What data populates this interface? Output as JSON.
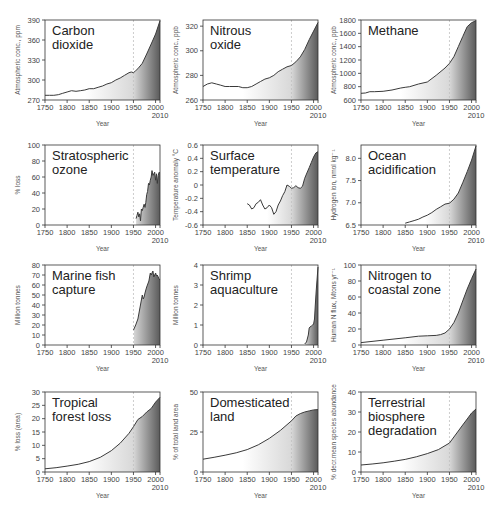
{
  "figure": {
    "colors": {
      "line": "#3a3a3a",
      "fill_light": "#ffffff",
      "fill_dark": "#5a5a5a",
      "axis": "#333333",
      "ref_line": "#c0c0c0",
      "text": "#222222"
    },
    "reference_year": 1950
  },
  "chart_data": [
    {
      "type": "area",
      "title": "Carbon dioxide",
      "title_lines": [
        "Carbon",
        "dioxide"
      ],
      "xlabel": "Year",
      "ylabel": "Atmospheric conc., ppm",
      "xlim": [
        1750,
        2010
      ],
      "ylim": [
        270,
        390
      ],
      "xticks": [
        1750,
        1800,
        1850,
        1900,
        1950,
        2000
      ],
      "xtick_extra": "2010",
      "yticks": [
        270,
        300,
        330,
        360,
        390
      ],
      "ref_line_x": 1950,
      "x": [
        1750,
        1760,
        1770,
        1780,
        1790,
        1800,
        1810,
        1820,
        1830,
        1840,
        1850,
        1860,
        1870,
        1880,
        1890,
        1900,
        1910,
        1920,
        1930,
        1940,
        1945,
        1950,
        1955,
        1960,
        1970,
        1980,
        1990,
        2000,
        2010
      ],
      "values": [
        277,
        277,
        277,
        278,
        280,
        282,
        284,
        283,
        284,
        285,
        287,
        287,
        289,
        291,
        294,
        296,
        300,
        303,
        307,
        311,
        312,
        311,
        314,
        317,
        325,
        339,
        354,
        369,
        389
      ]
    },
    {
      "type": "area",
      "title": "Nitrous oxide",
      "title_lines": [
        "Nitrous",
        "oxide"
      ],
      "xlabel": "Year",
      "ylabel": "Atmospheric conc., ppb",
      "xlim": [
        1750,
        2010
      ],
      "ylim": [
        260,
        325
      ],
      "xticks": [
        1750,
        1800,
        1850,
        1900,
        1950,
        2000
      ],
      "xtick_extra": "2010",
      "yticks": [
        260,
        280,
        300,
        320
      ],
      "ref_line_x": 1950,
      "x": [
        1750,
        1760,
        1770,
        1780,
        1790,
        1800,
        1810,
        1820,
        1830,
        1840,
        1850,
        1860,
        1870,
        1880,
        1890,
        1900,
        1910,
        1920,
        1930,
        1940,
        1950,
        1960,
        1970,
        1980,
        1990,
        2000,
        2010
      ],
      "values": [
        271,
        273,
        274,
        273,
        272,
        271,
        271,
        271,
        271,
        270,
        270,
        271,
        273,
        275,
        277,
        278,
        280,
        283,
        285,
        287,
        288,
        291,
        295,
        301,
        309,
        316,
        323
      ]
    },
    {
      "type": "area",
      "title": "Methane",
      "title_lines": [
        "Methane"
      ],
      "xlabel": "Year",
      "ylabel": "Atmospheric conc., ppb",
      "xlim": [
        1750,
        2010
      ],
      "ylim": [
        600,
        1800
      ],
      "xticks": [
        1750,
        1800,
        1850,
        1900,
        1950,
        2000
      ],
      "xtick_extra": "2010",
      "yticks": [
        600,
        800,
        1000,
        1200,
        1400,
        1600,
        1800
      ],
      "ref_line_x": 1950,
      "x": [
        1750,
        1760,
        1770,
        1780,
        1800,
        1820,
        1840,
        1850,
        1860,
        1880,
        1900,
        1920,
        1940,
        1950,
        1960,
        1970,
        1980,
        1990,
        2000,
        2010
      ],
      "values": [
        700,
        705,
        725,
        725,
        730,
        750,
        780,
        790,
        800,
        840,
        870,
        970,
        1080,
        1150,
        1250,
        1400,
        1550,
        1700,
        1760,
        1790
      ]
    },
    {
      "type": "area",
      "title": "Stratospheric ozone",
      "title_lines": [
        "Stratospheric",
        "ozone"
      ],
      "xlabel": "Year",
      "ylabel": "% loss",
      "xlim": [
        1750,
        2010
      ],
      "ylim": [
        0,
        100
      ],
      "xticks": [
        1750,
        1800,
        1850,
        1900,
        1950,
        2000
      ],
      "xtick_extra": "2010",
      "yticks": [
        0,
        20,
        40,
        60,
        80,
        100
      ],
      "ref_line_x": 1950,
      "x": [
        1956,
        1958,
        1960,
        1962,
        1964,
        1966,
        1968,
        1970,
        1972,
        1974,
        1976,
        1978,
        1980,
        1982,
        1984,
        1986,
        1988,
        1990,
        1992,
        1994,
        1996,
        1998,
        2000,
        2002,
        2004,
        2006,
        2008,
        2010
      ],
      "values": [
        8,
        12,
        16,
        10,
        14,
        5,
        20,
        18,
        22,
        26,
        22,
        28,
        38,
        42,
        52,
        50,
        56,
        60,
        68,
        62,
        64,
        66,
        56,
        64,
        52,
        62,
        66,
        65
      ]
    },
    {
      "type": "area",
      "title": "Surface temperature",
      "title_lines": [
        "Surface",
        "temperature"
      ],
      "xlabel": "Year",
      "ylabel": "Temperature anomaly °C",
      "xlim": [
        1750,
        2010
      ],
      "ylim": [
        -0.6,
        0.6
      ],
      "xticks": [
        1750,
        1800,
        1850,
        1900,
        1950,
        2000
      ],
      "xtick_extra": "2010",
      "yticks": [
        -0.6,
        -0.4,
        -0.2,
        0,
        0.2,
        0.4,
        0.6
      ],
      "ref_line_x": 1950,
      "x": [
        1850,
        1855,
        1860,
        1865,
        1870,
        1875,
        1880,
        1885,
        1890,
        1895,
        1900,
        1905,
        1910,
        1915,
        1920,
        1925,
        1930,
        1935,
        1940,
        1945,
        1950,
        1955,
        1960,
        1965,
        1970,
        1975,
        1980,
        1985,
        1990,
        1995,
        2000,
        2005,
        2010
      ],
      "values": [
        -0.28,
        -0.3,
        -0.36,
        -0.34,
        -0.28,
        -0.26,
        -0.22,
        -0.3,
        -0.36,
        -0.34,
        -0.3,
        -0.34,
        -0.44,
        -0.4,
        -0.3,
        -0.24,
        -0.16,
        -0.1,
        0.0,
        -0.02,
        -0.05,
        -0.04,
        -0.01,
        -0.04,
        -0.05,
        -0.02,
        0.1,
        0.18,
        0.26,
        0.34,
        0.42,
        0.48,
        0.5
      ]
    },
    {
      "type": "area",
      "title": "Ocean acidification",
      "title_lines": [
        "Ocean",
        "acidification"
      ],
      "xlabel": "Year",
      "ylabel": "Hydrogen ion, nmol kg⁻¹",
      "xlim": [
        1750,
        2010
      ],
      "ylim": [
        6.5,
        8.3
      ],
      "xticks": [
        1750,
        1800,
        1850,
        1900,
        1950,
        2000
      ],
      "xtick_extra": "2010",
      "yticks": [
        6.5,
        7.0,
        7.5,
        8.0
      ],
      "ytick_labels": [
        "6.5",
        "7.0",
        "7.5",
        "8.0"
      ],
      "ref_line_x": 1950,
      "x": [
        1850,
        1860,
        1870,
        1880,
        1890,
        1900,
        1910,
        1920,
        1930,
        1940,
        1950,
        1960,
        1970,
        1980,
        1990,
        2000,
        2010
      ],
      "values": [
        6.54,
        6.57,
        6.6,
        6.63,
        6.68,
        6.72,
        6.78,
        6.85,
        6.91,
        6.97,
        6.99,
        7.08,
        7.22,
        7.45,
        7.7,
        7.96,
        8.28
      ]
    },
    {
      "type": "area",
      "title": "Marine fish capture",
      "title_lines": [
        "Marine fish",
        "capture"
      ],
      "xlabel": "Year",
      "ylabel": "Million tonnes",
      "xlim": [
        1750,
        2010
      ],
      "ylim": [
        0,
        80
      ],
      "xticks": [
        1750,
        1800,
        1850,
        1900,
        1950,
        2000
      ],
      "xtick_extra": "2010",
      "yticks": [
        0,
        10,
        20,
        30,
        40,
        50,
        60,
        70,
        80
      ],
      "ref_line_x": 1950,
      "x": [
        1950,
        1955,
        1960,
        1965,
        1970,
        1972,
        1974,
        1976,
        1978,
        1980,
        1985,
        1988,
        1990,
        1992,
        1994,
        1996,
        1998,
        2000,
        2002,
        2004,
        2006,
        2008,
        2010
      ],
      "values": [
        15,
        20,
        26,
        38,
        50,
        46,
        48,
        52,
        55,
        58,
        64,
        72,
        70,
        72,
        74,
        68,
        70,
        72,
        69,
        70,
        68,
        66,
        65
      ]
    },
    {
      "type": "area",
      "title": "Shrimp aquaculture",
      "title_lines": [
        "Shrimp",
        "aquaculture"
      ],
      "xlabel": "Year",
      "ylabel": "Million tonnes",
      "xlim": [
        1750,
        2010
      ],
      "ylim": [
        0,
        4
      ],
      "xticks": [
        1750,
        1800,
        1850,
        1900,
        1950,
        2000
      ],
      "xtick_extra": "2010",
      "yticks": [
        0,
        1,
        2,
        3,
        4
      ],
      "ref_line_x": 1950,
      "x": [
        1980,
        1984,
        1988,
        1990,
        1992,
        1995,
        1998,
        2000,
        2002,
        2004,
        2006,
        2008,
        2010
      ],
      "values": [
        0.05,
        0.15,
        0.5,
        0.85,
        0.9,
        0.95,
        1.0,
        1.05,
        1.3,
        2.0,
        2.7,
        3.3,
        3.9
      ]
    },
    {
      "type": "area",
      "title": "Nitrogen to coastal zone",
      "title_lines": [
        "Nitrogen to",
        "coastal zone"
      ],
      "xlabel": "Year",
      "ylabel": "Human N flux, Mtons yr⁻¹",
      "xlim": [
        1750,
        2010
      ],
      "ylim": [
        0,
        100
      ],
      "xticks": [
        1750,
        1800,
        1850,
        1900,
        1950,
        2000
      ],
      "xtick_extra": "2010",
      "yticks": [
        0,
        20,
        40,
        60,
        80,
        100
      ],
      "ref_line_x": 1950,
      "x": [
        1750,
        1800,
        1850,
        1880,
        1900,
        1920,
        1930,
        1940,
        1950,
        1960,
        1970,
        1980,
        1990,
        2000,
        2010
      ],
      "values": [
        3,
        6,
        9,
        11,
        11.5,
        12,
        13,
        15,
        20,
        28,
        40,
        55,
        70,
        83,
        95
      ]
    },
    {
      "type": "area",
      "title": "Tropical forest loss",
      "title_lines": [
        "Tropical",
        "forest loss"
      ],
      "xlabel": "Year",
      "ylabel": "% loss (area)",
      "xlim": [
        1750,
        2010
      ],
      "ylim": [
        0,
        30
      ],
      "xticks": [
        1750,
        1800,
        1850,
        1900,
        1950,
        2000
      ],
      "xtick_extra": "2010",
      "yticks": [
        0,
        5,
        10,
        15,
        20,
        25,
        30
      ],
      "ref_line_x": 1950,
      "x": [
        1750,
        1775,
        1800,
        1825,
        1850,
        1875,
        1900,
        1920,
        1940,
        1950,
        1960,
        1970,
        1980,
        1990,
        2000,
        2010
      ],
      "values": [
        1.2,
        1.6,
        2.2,
        2.9,
        3.9,
        5.5,
        8.0,
        10.8,
        14.5,
        17,
        19.7,
        20.8,
        22.5,
        23.8,
        26.2,
        28
      ]
    },
    {
      "type": "area",
      "title": "Domesticated land",
      "title_lines": [
        "Domesticated",
        "land"
      ],
      "xlabel": "Year",
      "ylabel": "% of total land area",
      "xlim": [
        1750,
        2010
      ],
      "ylim": [
        0,
        50
      ],
      "xticks": [
        1750,
        1800,
        1850,
        1900,
        1950,
        2000
      ],
      "xtick_extra": "2010",
      "yticks": [
        0,
        25,
        50
      ],
      "ref_line_x": 1950,
      "x": [
        1750,
        1775,
        1800,
        1825,
        1850,
        1875,
        1900,
        1925,
        1950,
        1960,
        1970,
        1980,
        1990,
        2000,
        2010
      ],
      "values": [
        8,
        9.2,
        10.5,
        12,
        14,
        17,
        21,
        26,
        32,
        35,
        36.5,
        37.5,
        38.2,
        38.8,
        39
      ]
    },
    {
      "type": "area",
      "title": "Terrestrial biosphere degradation",
      "title_lines": [
        "Terrestrial",
        "biosphere",
        "degradation"
      ],
      "xlabel": "Year",
      "ylabel": "% decr.mean species abundance",
      "xlim": [
        1750,
        2010
      ],
      "ylim": [
        0,
        40
      ],
      "xticks": [
        1750,
        1800,
        1850,
        1900,
        1950,
        2000
      ],
      "xtick_extra": "2010",
      "yticks": [
        0,
        10,
        20,
        30,
        40
      ],
      "ref_line_x": 1950,
      "x": [
        1750,
        1775,
        1800,
        1825,
        1850,
        1875,
        1900,
        1925,
        1950,
        1960,
        1970,
        1980,
        1990,
        2000,
        2010
      ],
      "values": [
        3.5,
        4.0,
        4.6,
        5.4,
        6.3,
        7.6,
        9.2,
        11.2,
        14.5,
        17.5,
        20.5,
        23.5,
        26.5,
        29.5,
        31.5
      ]
    }
  ]
}
